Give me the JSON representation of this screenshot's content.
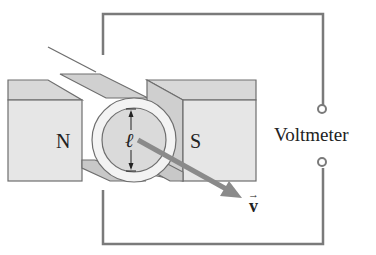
{
  "diagram": {
    "labels": {
      "north_pole": "N",
      "south_pole": "S",
      "length": "ℓ",
      "velocity": "v",
      "velocity_arrow": "→",
      "meter": "Voltmeter"
    },
    "colors": {
      "wire": "#7a7a7a",
      "magnet_face": "#e6e6e6",
      "magnet_top": "#d2d2d2",
      "magnet_edge": "#6e6e6e",
      "rail": "#c8c8c8",
      "ring": "#f3f3f3",
      "rod": "#d9d9d9",
      "velocity_vector": "#8a8a8a",
      "text": "#222222"
    }
  }
}
